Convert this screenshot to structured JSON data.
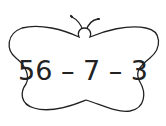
{
  "card": {
    "shape": "butterfly",
    "expression": "56 – 7 – 3",
    "stroke_color": "#222222",
    "fill_color": "#ffffff"
  }
}
